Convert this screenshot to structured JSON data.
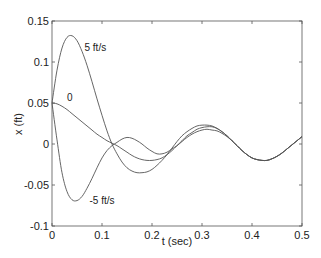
{
  "chart_data": {
    "type": "line",
    "title": "",
    "xlabel": "t (sec)",
    "ylabel": "x (ft)",
    "xlim": [
      0,
      0.5
    ],
    "ylim": [
      -0.1,
      0.15
    ],
    "xticks": [
      0,
      0.1,
      0.2,
      0.3,
      0.4,
      0.5
    ],
    "xtick_labels": [
      "0",
      "0.1",
      "0.2",
      "0.3",
      "0.4",
      "0.5"
    ],
    "yticks": [
      -0.1,
      -0.05,
      0,
      0.05,
      0.1,
      0.15
    ],
    "ytick_labels": [
      "-0.1",
      "-0.05",
      "0",
      "0.05",
      "0.1",
      "0.15"
    ],
    "grid": false,
    "legend": "none (inline annotations)",
    "series": [
      {
        "name": "5 ft/s",
        "label_pos": [
          0.065,
          0.113
        ],
        "x": [
          0,
          0.01,
          0.02,
          0.03,
          0.04,
          0.05,
          0.06,
          0.07,
          0.08,
          0.09,
          0.1,
          0.11,
          0.12,
          0.13,
          0.14,
          0.15,
          0.16,
          0.17,
          0.18,
          0.19,
          0.2,
          0.21,
          0.22,
          0.23,
          0.24,
          0.25,
          0.26,
          0.27,
          0.28,
          0.29,
          0.3,
          0.31,
          0.32,
          0.33,
          0.34,
          0.35,
          0.36,
          0.37,
          0.38,
          0.39,
          0.4,
          0.41,
          0.42,
          0.43,
          0.44,
          0.45,
          0.46,
          0.47,
          0.48,
          0.49,
          0.5
        ],
        "y": [
          0.05,
          0.09,
          0.117,
          0.13,
          0.132,
          0.126,
          0.113,
          0.096,
          0.076,
          0.055,
          0.035,
          0.016,
          0.0,
          -0.012,
          -0.022,
          -0.029,
          -0.033,
          -0.035,
          -0.035,
          -0.034,
          -0.031,
          -0.026,
          -0.02,
          -0.013,
          -0.005,
          0.003,
          0.01,
          0.015,
          0.019,
          0.022,
          0.023,
          0.023,
          0.022,
          0.019,
          0.015,
          0.01,
          0.004,
          -0.002,
          -0.008,
          -0.013,
          -0.017,
          -0.019,
          -0.02,
          -0.02,
          -0.018,
          -0.015,
          -0.011,
          -0.006,
          -0.001,
          0.004,
          0.009
        ]
      },
      {
        "name": "0",
        "label_pos": [
          0.03,
          0.053
        ],
        "x": [
          0,
          0.01,
          0.02,
          0.03,
          0.04,
          0.05,
          0.06,
          0.07,
          0.08,
          0.09,
          0.1,
          0.11,
          0.12,
          0.13,
          0.14,
          0.15,
          0.16,
          0.17,
          0.18,
          0.19,
          0.2,
          0.21,
          0.22,
          0.23,
          0.24,
          0.25,
          0.26,
          0.27,
          0.28,
          0.29,
          0.3,
          0.31,
          0.32,
          0.33,
          0.34,
          0.35,
          0.36,
          0.37,
          0.38,
          0.39,
          0.4,
          0.41,
          0.42,
          0.43,
          0.44,
          0.45,
          0.46,
          0.47,
          0.48,
          0.49,
          0.5
        ],
        "y": [
          0.05,
          0.049,
          0.046,
          0.042,
          0.037,
          0.032,
          0.027,
          0.022,
          0.017,
          0.012,
          0.008,
          0.004,
          0.001,
          -0.002,
          -0.006,
          -0.01,
          -0.014,
          -0.017,
          -0.019,
          -0.02,
          -0.02,
          -0.019,
          -0.017,
          -0.013,
          -0.008,
          -0.002,
          0.004,
          0.01,
          0.014,
          0.018,
          0.02,
          0.021,
          0.021,
          0.019,
          0.015,
          0.01,
          0.004,
          -0.002,
          -0.008,
          -0.013,
          -0.017,
          -0.019,
          -0.02,
          -0.02,
          -0.018,
          -0.015,
          -0.011,
          -0.006,
          -0.001,
          0.004,
          0.009
        ]
      },
      {
        "name": "-5 ft/s",
        "label_pos": [
          0.075,
          -0.073
        ],
        "x": [
          0,
          0.01,
          0.02,
          0.03,
          0.04,
          0.05,
          0.06,
          0.07,
          0.08,
          0.09,
          0.1,
          0.11,
          0.12,
          0.13,
          0.14,
          0.15,
          0.16,
          0.17,
          0.18,
          0.19,
          0.2,
          0.21,
          0.22,
          0.23,
          0.24,
          0.25,
          0.26,
          0.27,
          0.28,
          0.29,
          0.3,
          0.31,
          0.32,
          0.33,
          0.34,
          0.35,
          0.36,
          0.37,
          0.38,
          0.39,
          0.4,
          0.41,
          0.42,
          0.43,
          0.44,
          0.45,
          0.46,
          0.47,
          0.48,
          0.49,
          0.5
        ],
        "y": [
          0.05,
          0.005,
          -0.035,
          -0.058,
          -0.068,
          -0.069,
          -0.064,
          -0.054,
          -0.042,
          -0.029,
          -0.017,
          -0.008,
          -0.002,
          0.002,
          0.006,
          0.008,
          0.007,
          0.004,
          0.0,
          -0.005,
          -0.009,
          -0.012,
          -0.012,
          -0.01,
          -0.006,
          -0.002,
          0.003,
          0.008,
          0.012,
          0.015,
          0.017,
          0.018,
          0.017,
          0.016,
          0.013,
          0.009,
          0.004,
          -0.002,
          -0.008,
          -0.013,
          -0.017,
          -0.019,
          -0.02,
          -0.02,
          -0.018,
          -0.015,
          -0.011,
          -0.006,
          -0.001,
          0.004,
          0.009
        ]
      }
    ],
    "line_color": "#555555",
    "axis_color": "#444444"
  }
}
